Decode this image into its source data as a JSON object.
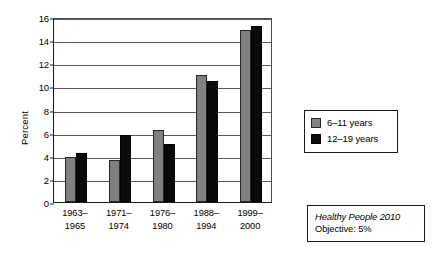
{
  "chart_data": {
    "type": "bar",
    "title": "",
    "xlabel": "",
    "ylabel": "Percent",
    "ylim": [
      0,
      16
    ],
    "ytick_step": 2,
    "yticks": [
      0,
      2,
      4,
      6,
      8,
      10,
      12,
      14,
      16
    ],
    "grid": true,
    "legend_position": "right",
    "categories": [
      "1963–\n1965",
      "1971–\n1974",
      "1976–\n1980",
      "1988–\n1994",
      "1999–\n2000"
    ],
    "category_lines": [
      [
        "1963–",
        "1965"
      ],
      [
        "1971–",
        "1974"
      ],
      [
        "1976–",
        "1980"
      ],
      [
        "1988–",
        "1994"
      ],
      [
        "1999–",
        "2000"
      ]
    ],
    "series": [
      {
        "name": "6–11 years",
        "color": "#808080",
        "values": [
          3.9,
          3.6,
          6.2,
          11.0,
          14.9
        ]
      },
      {
        "name": "12–19 years",
        "color": "#0a0a0a",
        "values": [
          4.25,
          5.8,
          5.0,
          10.5,
          15.2
        ]
      }
    ]
  },
  "legend": {
    "items": [
      {
        "label": "6–11 years",
        "swatch": "gray-swatch-icon"
      },
      {
        "label": "12–19 years",
        "swatch": "black-swatch-icon"
      }
    ]
  },
  "annotation": {
    "line1": "Healthy People 2010",
    "line2": "Objective: 5%"
  },
  "colors": {
    "series_1": "#808080",
    "series_2": "#0a0a0a",
    "axis": "#1a1a1a",
    "grid": "#5a5a5a",
    "background": "#ffffff"
  }
}
